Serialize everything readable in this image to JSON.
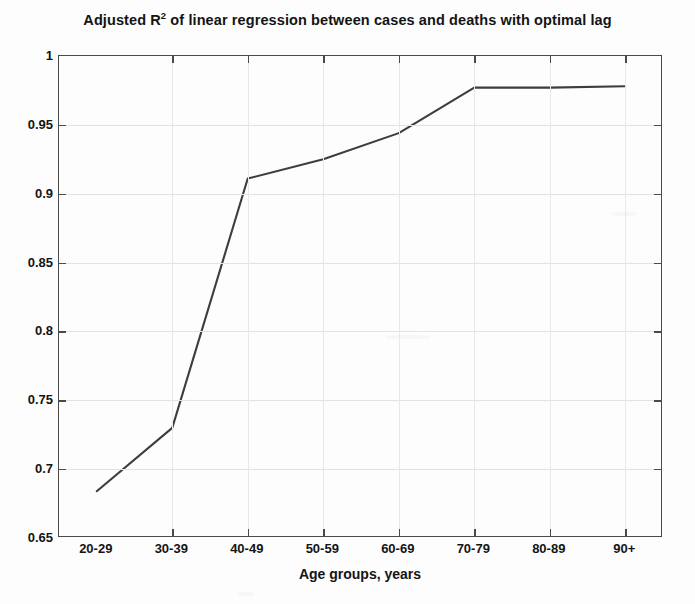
{
  "chart_data": {
    "type": "line",
    "title": "Adjusted R2 of linear regression between cases and deaths with optimal lag",
    "title_prefix": "Adjusted R",
    "title_superscript": "2",
    "title_suffix": " of linear regression between cases and deaths with optimal lag",
    "xlabel": "Age groups, years",
    "ylabel": "",
    "categories": [
      "20-29",
      "30-39",
      "40-49",
      "50-59",
      "60-69",
      "70-79",
      "80-89",
      "90+"
    ],
    "values": [
      0.684,
      0.73,
      0.911,
      0.925,
      0.944,
      0.977,
      0.977,
      0.978
    ],
    "series": [
      {
        "name": "Adjusted R2",
        "values": [
          0.684,
          0.73,
          0.911,
          0.925,
          0.944,
          0.977,
          0.977,
          0.978
        ]
      }
    ],
    "ylim": [
      0.65,
      1
    ],
    "yticks": [
      0.65,
      0.7,
      0.75,
      0.8,
      0.85,
      0.9,
      0.95,
      1
    ],
    "ytick_labels": [
      "0.65",
      "0.7",
      "0.75",
      "0.8",
      "0.85",
      "0.9",
      "0.95",
      "1"
    ],
    "xlim": [
      0,
      8
    ],
    "grid": true,
    "legend": false,
    "line_color": "#3d3d3d",
    "axis_color": "#4a4a4a",
    "background_color": "#fdfdfd"
  }
}
